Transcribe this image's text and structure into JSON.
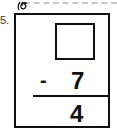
{
  "worksheet": {
    "question_number": "5.",
    "problem": {
      "minuend": "",
      "operator": "-",
      "subtrahend": "7",
      "result": "4"
    },
    "icons": [
      "spiral-icon"
    ]
  }
}
